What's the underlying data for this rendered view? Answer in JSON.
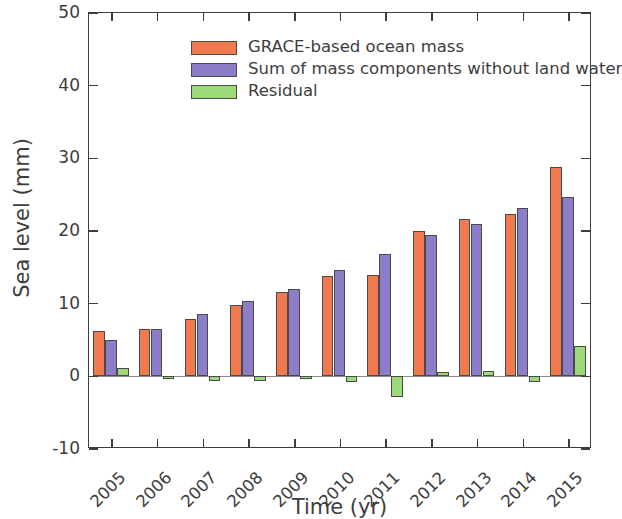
{
  "chart_data": {
    "type": "bar",
    "title": "",
    "xlabel": "Time (yr)",
    "ylabel": "Sea level (mm)",
    "categories": [
      "2005",
      "2006",
      "2007",
      "2008",
      "2009",
      "2010",
      "2011",
      "2012",
      "2013",
      "2014",
      "2015"
    ],
    "ylim": [
      -10,
      50
    ],
    "yticks": [
      -10,
      0,
      10,
      20,
      30,
      40,
      50
    ],
    "ytick_labels": [
      "-10",
      "0",
      "10",
      "20",
      "30",
      "40",
      "50"
    ],
    "grid": false,
    "legend_position": "upper left",
    "series": [
      {
        "name": "GRACE-based ocean mass",
        "color": "#F0794E",
        "values": [
          6.2,
          6.5,
          7.9,
          9.8,
          11.6,
          13.8,
          13.9,
          20.0,
          21.6,
          22.3,
          28.8
        ]
      },
      {
        "name": "Sum of mass components without land water",
        "color": "#8D7DC8",
        "values": [
          5.0,
          6.5,
          8.6,
          10.4,
          12.0,
          14.6,
          16.9,
          19.4,
          21.0,
          23.1,
          24.7
        ]
      },
      {
        "name": "Residual",
        "color": "#9BD97A",
        "values": [
          1.2,
          -0.1,
          -0.7,
          -0.6,
          -0.4,
          -0.8,
          -2.9,
          0.6,
          0.8,
          -0.8,
          4.2
        ]
      }
    ]
  },
  "legend": {
    "items": [
      {
        "label": "GRACE-based ocean mass",
        "color": "#F0794E"
      },
      {
        "label": "Sum of mass components without land water",
        "color": "#8D7DC8"
      },
      {
        "label": "Residual",
        "color": "#9BD97A"
      }
    ]
  },
  "axes": {
    "y_title": "Sea level (mm)",
    "x_title": "Time (yr)"
  }
}
